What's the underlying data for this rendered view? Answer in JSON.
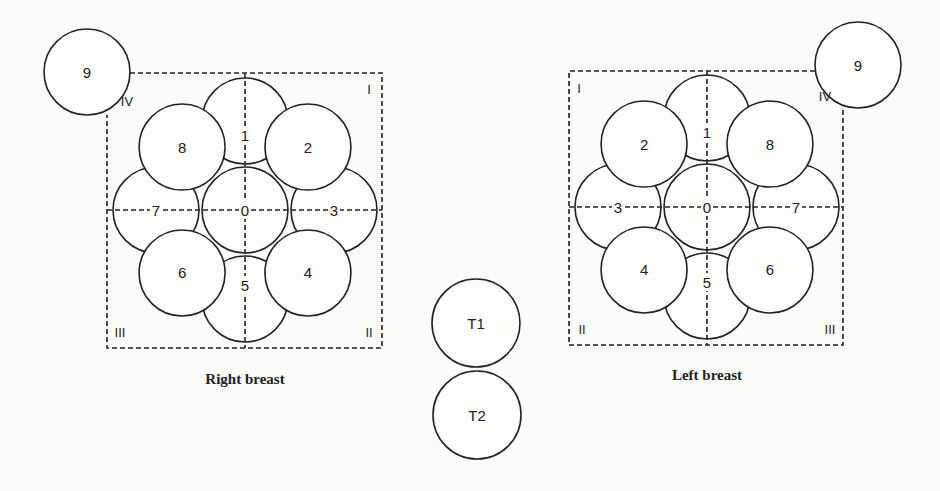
{
  "diagram": {
    "right_breast": {
      "caption": "Right breast",
      "center": [
        245,
        210
      ],
      "box": [
        107,
        73,
        382,
        348
      ],
      "circle_radius": 43,
      "ring_radius": 89,
      "sectors": [
        {
          "label": "0",
          "angle": null
        },
        {
          "label": "1",
          "angle": 0
        },
        {
          "label": "2",
          "angle": 45
        },
        {
          "label": "3",
          "angle": 90
        },
        {
          "label": "4",
          "angle": 135
        },
        {
          "label": "5",
          "angle": 180
        },
        {
          "label": "6",
          "angle": 225
        },
        {
          "label": "7",
          "angle": 270
        },
        {
          "label": "8",
          "angle": 315
        }
      ],
      "axillary": {
        "label": "9",
        "cx": 87,
        "cy": 72
      },
      "quadrants": {
        "top_left": "IV",
        "top_right": "I",
        "bottom_left": "III",
        "bottom_right": "II"
      }
    },
    "left_breast": {
      "caption": "Left breast",
      "center": [
        707,
        207
      ],
      "box": [
        569,
        71,
        843,
        345
      ],
      "circle_radius": 43,
      "ring_radius": 89,
      "sectors": [
        {
          "label": "0",
          "angle": null
        },
        {
          "label": "1",
          "angle": 0
        },
        {
          "label": "2",
          "angle": 315
        },
        {
          "label": "3",
          "angle": 270
        },
        {
          "label": "4",
          "angle": 225
        },
        {
          "label": "5",
          "angle": 180
        },
        {
          "label": "6",
          "angle": 135
        },
        {
          "label": "7",
          "angle": 90
        },
        {
          "label": "8",
          "angle": 45
        }
      ],
      "axillary": {
        "label": "9",
        "cx": 858,
        "cy": 65
      },
      "quadrants": {
        "top_left": "I",
        "top_right": "IV",
        "bottom_left": "II",
        "bottom_right": "III"
      }
    },
    "extra": [
      {
        "label": "T1",
        "cx": 476,
        "cy": 323,
        "r": 44
      },
      {
        "label": "T2",
        "cx": 477,
        "cy": 415,
        "r": 44
      }
    ]
  }
}
